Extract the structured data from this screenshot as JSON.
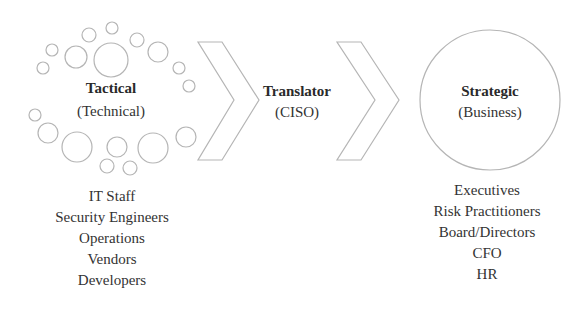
{
  "tactical": {
    "title": "Tactical",
    "subtitle": "(Technical)",
    "roles": [
      "IT Staff",
      "Security Engineers",
      "Operations",
      "Vendors",
      "Developers"
    ]
  },
  "translator": {
    "title": "Translator",
    "subtitle": "(CISO)"
  },
  "strategic": {
    "title": "Strategic",
    "subtitle": "(Business)",
    "roles": [
      "Executives",
      "Risk Practitioners",
      "Board/Directors",
      "CFO",
      "HR"
    ]
  },
  "colors": {
    "outline": "#b5b5b5",
    "text": "#2a2a2a"
  }
}
